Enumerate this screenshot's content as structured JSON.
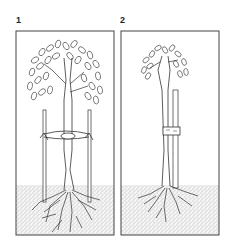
{
  "panels": [
    {
      "label": "1",
      "description": "Tree supported by two stakes with a cross-tie"
    },
    {
      "label": "2",
      "description": "Tree supported by a single short stake with a band tie"
    }
  ],
  "colors": {
    "line": "#333333",
    "soil": "#cfcfcf",
    "background": "#ffffff"
  }
}
